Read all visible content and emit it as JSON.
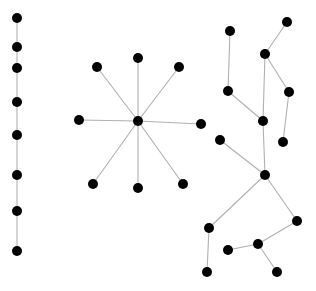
{
  "diagram": {
    "type": "graph",
    "node_color": "#000000",
    "edge_color": "#b0b0b0",
    "node_radius": 5,
    "components": [
      {
        "name": "path-graph",
        "nodes": [
          [
            17,
            18
          ],
          [
            17,
            47
          ],
          [
            17,
            68
          ],
          [
            17,
            102
          ],
          [
            17,
            135
          ],
          [
            17,
            175
          ],
          [
            17,
            211
          ],
          [
            17,
            251
          ]
        ],
        "edges": [
          [
            0,
            1
          ],
          [
            1,
            2
          ],
          [
            2,
            3
          ],
          [
            3,
            4
          ],
          [
            4,
            5
          ],
          [
            5,
            6
          ],
          [
            6,
            7
          ]
        ]
      },
      {
        "name": "star-graph",
        "nodes": [
          [
            138,
            121
          ],
          [
            97,
            67
          ],
          [
            138,
            58
          ],
          [
            179,
            67
          ],
          [
            79,
            120
          ],
          [
            201,
            124
          ],
          [
            93,
            184
          ],
          [
            138,
            188
          ],
          [
            183,
            184
          ]
        ],
        "edges": [
          [
            0,
            1
          ],
          [
            0,
            2
          ],
          [
            0,
            3
          ],
          [
            0,
            4
          ],
          [
            0,
            5
          ],
          [
            0,
            6
          ],
          [
            0,
            7
          ],
          [
            0,
            8
          ]
        ]
      },
      {
        "name": "tree-graph",
        "nodes": [
          [
            230,
            31
          ],
          [
            287,
            22
          ],
          [
            265,
            54
          ],
          [
            228,
            91
          ],
          [
            289,
            92
          ],
          [
            263,
            121
          ],
          [
            283,
            142
          ],
          [
            220,
            140
          ],
          [
            265,
            175
          ],
          [
            209,
            228
          ],
          [
            297,
            221
          ],
          [
            258,
            244
          ],
          [
            228,
            250
          ],
          [
            207,
            272
          ],
          [
            277,
            272
          ]
        ],
        "edges": [
          [
            0,
            3
          ],
          [
            3,
            5
          ],
          [
            1,
            2
          ],
          [
            2,
            5
          ],
          [
            2,
            4
          ],
          [
            4,
            6
          ],
          [
            5,
            8
          ],
          [
            7,
            8
          ],
          [
            8,
            9
          ],
          [
            9,
            13
          ],
          [
            8,
            10
          ],
          [
            10,
            11
          ],
          [
            11,
            12
          ],
          [
            11,
            14
          ]
        ]
      }
    ]
  }
}
